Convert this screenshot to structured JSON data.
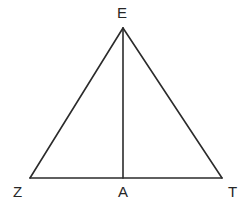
{
  "figure": {
    "kind": "geometry-diagram",
    "shape": "triangle-with-altitude",
    "background_color": "#ffffff",
    "stroke_color": "#2b2b2b",
    "label_color": "#262626",
    "width": 246,
    "height": 206
  },
  "labels": {
    "apex": "E",
    "base_left": "Z",
    "base_mid": "A",
    "base_right": "T"
  },
  "points": {
    "E": {
      "x": 123,
      "y": 28
    },
    "Z": {
      "x": 30,
      "y": 178
    },
    "A": {
      "x": 123,
      "y": 178
    },
    "T": {
      "x": 222,
      "y": 178
    }
  },
  "segments": [
    {
      "name": "EZ",
      "from": "E",
      "to": "Z"
    },
    {
      "name": "ET",
      "from": "E",
      "to": "T"
    },
    {
      "name": "ZT",
      "from": "Z",
      "to": "T"
    },
    {
      "name": "EA",
      "from": "E",
      "to": "A"
    }
  ]
}
